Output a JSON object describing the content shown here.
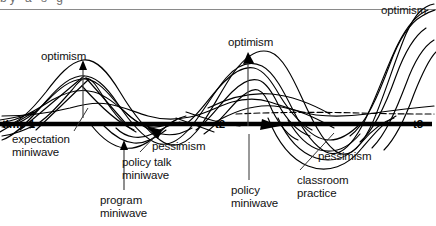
{
  "figure": {
    "kind": "line-diagram",
    "background": "#ffffff",
    "ink": "#000000",
    "top_rule_color": "#8a8a8a",
    "cut_off_header_text": "by   a   s  g",
    "axis": {
      "label_color": "#000000",
      "baseline_y": 124,
      "ticks": [
        {
          "id": "t1",
          "label": "time 1",
          "x": 4,
          "y": 124
        },
        {
          "id": "t2",
          "label": "t2",
          "x": 216,
          "y": 124
        },
        {
          "id": "t3",
          "label": "t3",
          "x": 414,
          "y": 124
        }
      ]
    },
    "annotations": [
      {
        "id": "optimism-left",
        "label": "optimism",
        "x": 41,
        "y": 55,
        "anchor": "left"
      },
      {
        "id": "optimism-mid",
        "label": "optimism",
        "x": 228,
        "y": 36,
        "anchor": "left"
      },
      {
        "id": "optimism-right",
        "label": "optimism",
        "x": 381,
        "y": 6,
        "anchor": "left"
      },
      {
        "id": "pessimism-left",
        "label": "pessimism",
        "x": 153,
        "y": 147,
        "anchor": "left"
      },
      {
        "id": "pessimism-right",
        "label": "pessimism",
        "x": 318,
        "y": 152,
        "anchor": "left"
      },
      {
        "id": "expectation-miniwave",
        "label": "expectation\nminiwave",
        "x": 12,
        "y": 133,
        "anchor": "left"
      },
      {
        "id": "policy-talk-miniwave",
        "label": "policy talk\nminiwave",
        "x": 122,
        "y": 157,
        "anchor": "left"
      },
      {
        "id": "program-miniwave",
        "label": "program\nminiwave",
        "x": 100,
        "y": 196,
        "anchor": "left"
      },
      {
        "id": "policy-miniwave",
        "label": "policy\nminiwave",
        "x": 229,
        "y": 186,
        "anchor": "left"
      },
      {
        "id": "classroom-practice",
        "label": "classroom\npractice",
        "x": 297,
        "y": 176,
        "anchor": "left"
      }
    ],
    "annotation_lines": [
      {
        "id": "expectation-leader",
        "from": [
          71,
          133
        ],
        "to": [
          88,
          104
        ]
      },
      {
        "id": "policy-talk-leader",
        "from": [
          140,
          152
        ],
        "to": [
          158,
          131
        ]
      },
      {
        "id": "program-leader",
        "from": [
          124,
          190
        ],
        "to": [
          124,
          137
        ]
      },
      {
        "id": "policy-leader",
        "from": [
          249,
          180
        ],
        "to": [
          249,
          131
        ]
      },
      {
        "id": "classroom-leader",
        "from": [
          300,
          170
        ],
        "to": [
          332,
          133
        ]
      }
    ],
    "arrows": [
      {
        "id": "optimism-left-arrow",
        "from": [
          83,
          112
        ],
        "to": [
          83,
          62
        ]
      },
      {
        "id": "optimism-mid-arrow",
        "from": [
          248,
          124
        ],
        "to": [
          248,
          54
        ]
      },
      {
        "id": "program-arrow",
        "from": [
          124,
          190
        ],
        "to": [
          124,
          140
        ]
      }
    ]
  }
}
